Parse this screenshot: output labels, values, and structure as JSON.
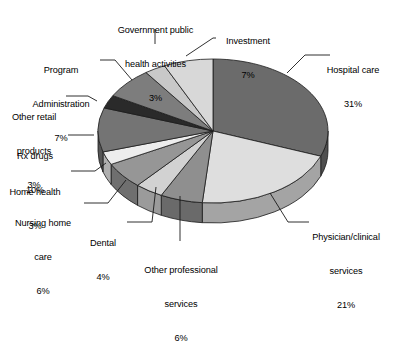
{
  "chart_data": {
    "type": "pie",
    "title": "",
    "subtitle": "",
    "xlabel": "",
    "ylabel": "",
    "legend_position": "callout-labels",
    "grid": false,
    "units": "percent",
    "three_d": true,
    "start_angle_deg": 0,
    "direction": "clockwise",
    "categories": [
      "Hospital care",
      "Physician/clinical services",
      "Other professional services",
      "Dental",
      "Nursing home care",
      "Home health",
      "Rx drugs",
      "Other retail products",
      "Program Administration",
      "Government public health activities",
      "Investment"
    ],
    "values": [
      31,
      21,
      6,
      4,
      6,
      3,
      10,
      3,
      7,
      3,
      7
    ],
    "slices": [
      {
        "label": "Hospital care",
        "value": 31,
        "pct_text": "31%",
        "color": "#6b6b6b"
      },
      {
        "label": "Physician/clinical services",
        "value": 21,
        "pct_text": "21%",
        "color": "#dedede"
      },
      {
        "label": "Other professional services",
        "value": 6,
        "pct_text": "6%",
        "color": "#8f8f8f"
      },
      {
        "label": "Dental",
        "value": 4,
        "pct_text": "4%",
        "color": "#d2d2d2"
      },
      {
        "label": "Nursing home care",
        "value": 6,
        "pct_text": "6%",
        "color": "#969696"
      },
      {
        "label": "Home health",
        "value": 3,
        "pct_text": "3%",
        "color": "#ededed"
      },
      {
        "label": "Rx drugs",
        "value": 10,
        "pct_text": "10%",
        "color": "#747474"
      },
      {
        "label": "Other retail products",
        "value": 3,
        "pct_text": "3%",
        "color": "#2a2a2a"
      },
      {
        "label": "Program Administration",
        "value": 7,
        "pct_text": "7%",
        "color": "#7d7d7d"
      },
      {
        "label": "Government public health activities",
        "value": 3,
        "pct_text": "3%",
        "color": "#c8c8c8"
      },
      {
        "label": "Investment",
        "value": 7,
        "pct_text": "7%",
        "color": "#d8d8d8"
      }
    ]
  },
  "labels": {
    "government": {
      "line1": "Government public",
      "line2": "health activities",
      "pct": "3%"
    },
    "investment": {
      "line1": "Investment",
      "pct": "7%"
    },
    "hospital": {
      "line1": "Hospital care",
      "pct": "31%"
    },
    "physician": {
      "line1": "Physician/clinical",
      "line2": "services",
      "pct": "21%"
    },
    "other_prof": {
      "line1": "Other professional",
      "line2": "services",
      "pct": "6%"
    },
    "dental": {
      "line1": "Dental",
      "pct": "4%"
    },
    "nursing": {
      "line1": "Nursing home",
      "line2": "care",
      "pct": "6%"
    },
    "home": {
      "line1": "Home health",
      "pct": "3%"
    },
    "rx": {
      "line1": "Rx drugs",
      "pct": "10%"
    },
    "retail": {
      "line1": "Other retail",
      "line2": "products",
      "pct": "3%"
    },
    "program": {
      "line1": "Program",
      "line2": "Administration",
      "pct": "7%"
    }
  },
  "style": {
    "background": "#ffffff",
    "stroke": "#1a1a1a",
    "leader_line": "#1a1a1a"
  }
}
